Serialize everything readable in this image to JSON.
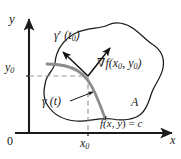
{
  "figure": {
    "type": "math-diagram",
    "width": 181,
    "height": 159,
    "background_color": "#ffffff"
  },
  "axes": {
    "y_axis_label": "y",
    "x_axis_label": "x",
    "origin_label": "0",
    "axis_color": "#1a1a1a",
    "y0_value": "y",
    "y0_subscript": "0",
    "x0_value": "x",
    "x0_subscript": "0"
  },
  "labels": {
    "tangent_vector": {
      "gamma": "γ",
      "prime": "′",
      "open": " (",
      "param": "t",
      "sub": "0",
      "close": ")"
    },
    "gradient_vector": {
      "nabla": "∇",
      "f": "f",
      "open": "(",
      "x": "x",
      "xsub": "0",
      "comma": ", ",
      "y": "y",
      "ysub": "0",
      "close": ")"
    },
    "curve": {
      "gamma": "γ",
      "open": " (",
      "param": "t",
      "close": ")"
    },
    "region": "A",
    "level_set": {
      "f": "f",
      "open": "(",
      "x": "x",
      "comma": ", ",
      "y": "y",
      "close": ") = ",
      "c": "c"
    }
  },
  "colors": {
    "level_curve": "#8c8c8c",
    "region_outline": "#1a1a1a",
    "dashed_guide": "#9a9a9a",
    "arrow": "#111111",
    "text": "#1a1a1a"
  },
  "geometry": {
    "origin_px": [
      29,
      133
    ],
    "tangent_point_px": [
      88,
      76
    ],
    "y0_tick_px": 76,
    "x0_tick_px": 88
  }
}
